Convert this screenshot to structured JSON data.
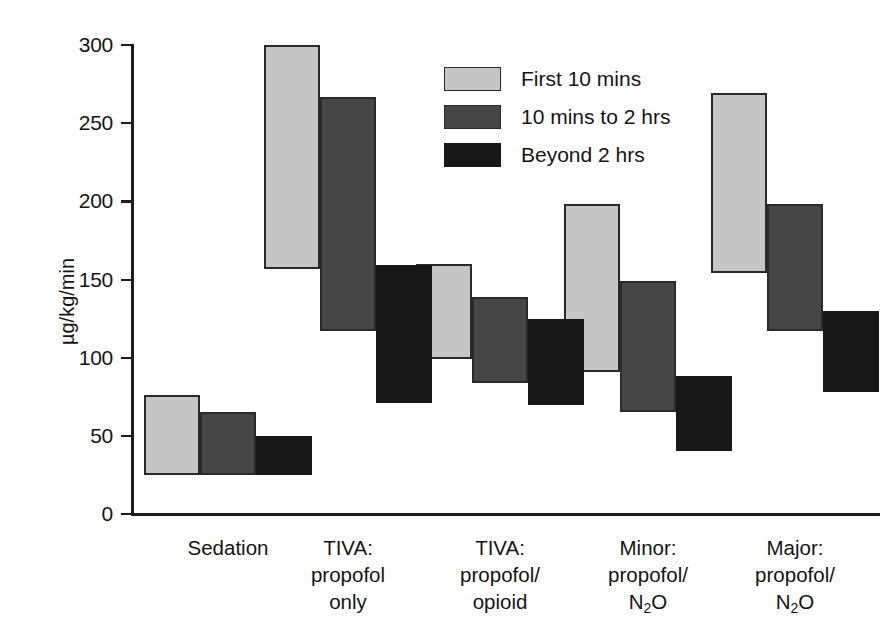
{
  "chart_data": {
    "type": "bar",
    "bar_style": "floating-range",
    "title": "",
    "subtitle": "",
    "xlabel": "",
    "ylabel": "µg/kg/min",
    "ylim": [
      0,
      300
    ],
    "yticks": [
      0,
      50,
      100,
      150,
      200,
      250,
      300
    ],
    "grid": false,
    "legend_position": "top-center",
    "categories": [
      "Sedation",
      "TIVA: propofol only",
      "TIVA: propofol/ opioid",
      "Minor: propofol/ N2O",
      "Major: propofol/ N2O"
    ],
    "series": [
      {
        "name": "First 10 mins",
        "color": "#c6c6c6",
        "low": [
          25,
          157,
          99,
          91,
          154
        ],
        "high": [
          76,
          300,
          160,
          198,
          269
        ]
      },
      {
        "name": "10 mins to 2 hrs",
        "color": "#464646",
        "low": [
          25,
          117,
          84,
          65,
          117
        ],
        "high": [
          65,
          267,
          139,
          149,
          198
        ]
      },
      {
        "name": "Beyond 2 hrs",
        "color": "#171717",
        "low": [
          25,
          71,
          70,
          40,
          78
        ],
        "high": [
          50,
          159,
          125,
          88,
          130
        ]
      }
    ]
  },
  "axis": {
    "y_title": "µg/kg/min",
    "ticks": [
      {
        "value": 300,
        "label": "300"
      },
      {
        "value": 250,
        "label": "250"
      },
      {
        "value": 200,
        "label": "200"
      },
      {
        "value": 150,
        "label": "150"
      },
      {
        "value": 100,
        "label": "100"
      },
      {
        "value": 50,
        "label": "50"
      },
      {
        "value": 0,
        "label": "0"
      }
    ]
  },
  "legend": {
    "items": [
      {
        "label": "First 10 mins",
        "color": "#c6c6c6"
      },
      {
        "label": "10 mins to 2 hrs",
        "color": "#464646"
      },
      {
        "label": "Beyond 2 hrs",
        "color": "#171717"
      }
    ]
  },
  "x_categories": [
    {
      "lines": [
        "Sedation"
      ]
    },
    {
      "lines": [
        "TIVA:",
        "propofol",
        "only"
      ]
    },
    {
      "lines": [
        "TIVA:",
        "propofol/",
        "opioid"
      ]
    },
    {
      "lines": [
        "Minor:",
        "propofol/",
        "N",
        "2",
        "O"
      ],
      "formatted": [
        "Minor:",
        "propofol/",
        "N₂O"
      ]
    },
    {
      "lines": [
        "Major:",
        "propofol/",
        "N",
        "2",
        "O"
      ],
      "formatted": [
        "Major:",
        "propofol/",
        "N₂O"
      ]
    }
  ],
  "colors": {
    "series_light": "#c6c6c6",
    "series_dark": "#464646",
    "series_black": "#171717",
    "axis": "#1c1c1c",
    "text": "#141414",
    "background": "#ffffff"
  }
}
